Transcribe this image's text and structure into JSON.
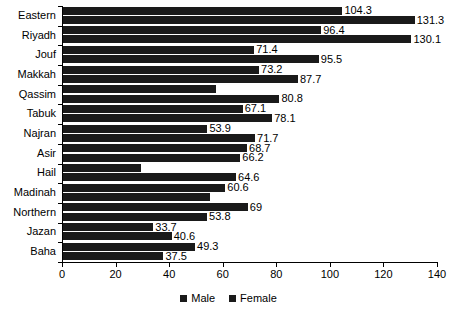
{
  "chart_data": {
    "type": "bar",
    "orientation": "horizontal",
    "title": "",
    "subtitle": "",
    "xlabel": "",
    "ylabel": "",
    "xlim": [
      0,
      140
    ],
    "xticks": [
      0,
      20,
      40,
      60,
      80,
      100,
      120,
      140
    ],
    "grid": false,
    "legend_position": "bottom",
    "categories": [
      "Eastern",
      "Riyadh",
      "Jouf",
      "Makkah",
      "Qassim",
      "Tabuk",
      "Najran",
      "Asir",
      "Hail",
      "Madinah",
      "Northern",
      "Jazan",
      "Baha"
    ],
    "series": [
      {
        "name": "Male",
        "color": "#1a1a1a",
        "values": [
          104.3,
          96.4,
          71.4,
          73.2,
          57.0,
          67.1,
          53.9,
          68.7,
          29.0,
          60.6,
          69.0,
          33.7,
          49.3
        ],
        "labels": [
          "104.3",
          "96.4",
          "71.4",
          "73.2",
          "",
          "67.1",
          "53.9",
          "68.7",
          "",
          "60.6",
          "69",
          "33.7",
          "49.3"
        ]
      },
      {
        "name": "Female",
        "color": "#1a1a1a",
        "values": [
          131.3,
          130.1,
          95.5,
          87.7,
          80.8,
          78.1,
          71.7,
          66.2,
          64.6,
          55.0,
          53.8,
          40.6,
          37.5
        ],
        "labels": [
          "131.3",
          "130.1",
          "95.5",
          "87.7",
          "80.8",
          "78.1",
          "71.7",
          "66.2",
          "64.6",
          "",
          "53.8",
          "40.6",
          "37.5"
        ]
      }
    ]
  },
  "legend": {
    "items": [
      {
        "label": "Male"
      },
      {
        "label": "Female"
      }
    ]
  },
  "axis": {
    "x_tick_labels": [
      "0",
      "20",
      "40",
      "60",
      "80",
      "100",
      "120",
      "140"
    ]
  }
}
